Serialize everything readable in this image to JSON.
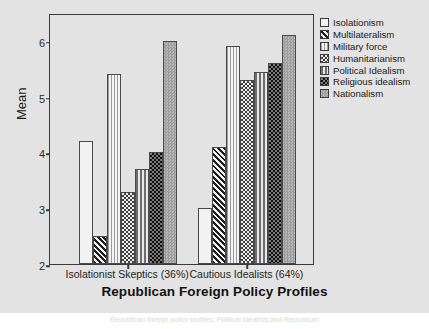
{
  "figure": {
    "background_color": "#e3e3e3",
    "frame_color": "#3a3a3a"
  },
  "caption": "Republican foreign policy profiles: Political Idealists and Republican",
  "chart_data": {
    "type": "bar",
    "title": "",
    "xlabel": "Republican Foreign Policy Profiles",
    "ylabel": "Mean",
    "ylim": [
      2,
      6.5
    ],
    "yticks": [
      2,
      3,
      4,
      5,
      6
    ],
    "ytick_labels": [
      "2",
      "3",
      "4",
      "5",
      "6"
    ],
    "grid": false,
    "legend_position": "top-right",
    "categories": [
      "Isolationist Skeptics (36%)",
      "Cautious Idealists (64%)"
    ],
    "series": [
      {
        "name": "Isolationism",
        "pattern": "empty",
        "values": [
          4.2,
          3.0
        ]
      },
      {
        "name": "Multilateralism",
        "pattern": "diagonal",
        "values": [
          2.5,
          4.1
        ]
      },
      {
        "name": "Military force",
        "pattern": "vfine",
        "values": [
          5.4,
          5.9
        ]
      },
      {
        "name": "Humanitarianism",
        "pattern": "check",
        "values": [
          3.3,
          5.3
        ]
      },
      {
        "name": "Political Idealism",
        "pattern": "vthick",
        "values": [
          3.7,
          5.45
        ]
      },
      {
        "name": "Religious idealism",
        "pattern": "darkcheck",
        "values": [
          4.0,
          5.6
        ]
      },
      {
        "name": "Nationalism",
        "pattern": "solid",
        "values": [
          6.0,
          6.1
        ]
      }
    ]
  }
}
